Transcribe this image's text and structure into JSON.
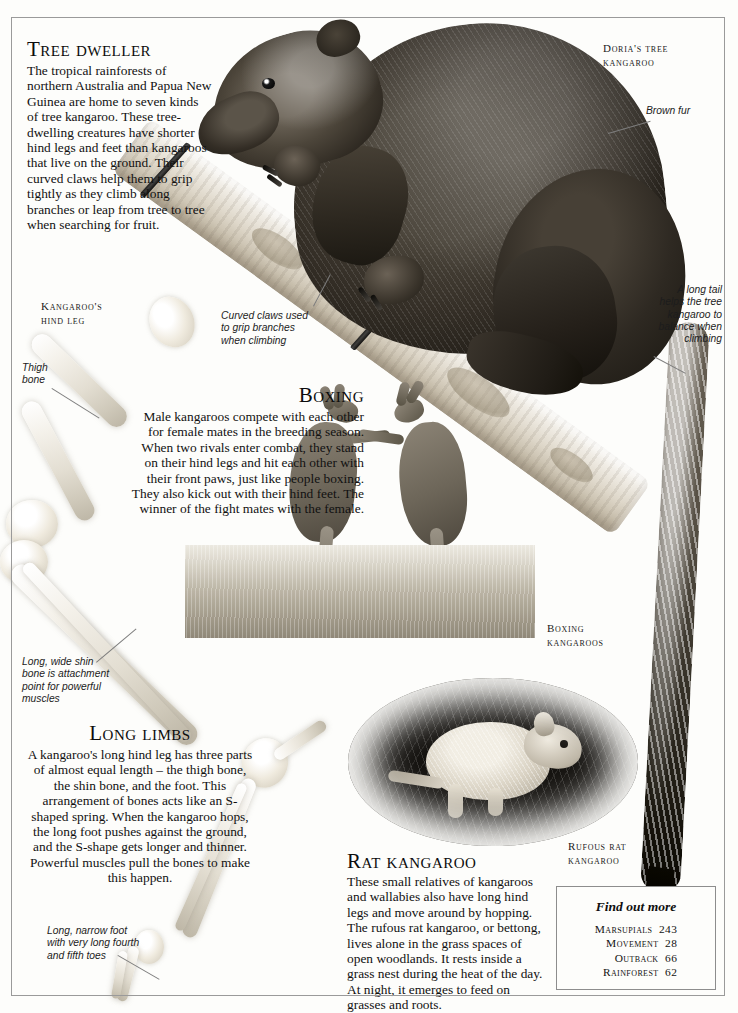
{
  "articles": {
    "tree_dweller": {
      "heading": "Tree dweller",
      "body": "The tropical rainforests of northern Australia and Papua New Guinea are home to seven kinds of tree kangaroo. These tree-dwelling creatures have shorter hind legs and feet than kangaroos that live on the ground. Their curved claws help them to grip tightly as they climb along branches or leap from tree to tree when searching for fruit."
    },
    "boxing": {
      "heading": "Boxing",
      "body": "Male kangaroos compete with each other for female mates in the breeding season. When two rivals enter combat, they stand on their hind legs and hit each other with their front paws, just like people boxing. They also kick out with their hind feet. The winner of the fight mates with the female."
    },
    "long_limbs": {
      "heading": "Long limbs",
      "body": "A kangaroo's long hind leg has three parts of almost equal length – the thigh bone, the shin bone, and the foot. This arrangement of bones acts like an S-shaped spring. When the kangaroo hops, the long foot pushes against the ground, and the S-shape gets longer and thinner. Powerful muscles pull the bones to make this happen."
    },
    "rat_kangaroo": {
      "heading": "Rat kangaroo",
      "body": "These small relatives of kangaroos and wallabies also have long hind legs and move around by hopping. The rufous rat kangaroo, or bettong, lives alone in the grass spaces of open woodlands. It rests inside a grass nest during the heat of the day. At night, it emerges to feed on grasses and roots."
    }
  },
  "labels": {
    "dorias_tree_kangaroo": "Doria's tree\nkangaroo",
    "kangaroos_hind_leg": "Kangaroo's\nhind leg",
    "boxing_kangaroos": "Boxing\nkangaroos",
    "rufous_rat_kangaroo": "Rufous rat\nkangaroo"
  },
  "annotations": {
    "brown_fur": "Brown fur",
    "long_tail": "A long tail\nhelps the tree\nkangaroo to\nbalance when\nclimbing",
    "curved_claws": "Curved claws used\nto grip branches\nwhen climbing",
    "thigh_bone": "Thigh\nbone",
    "shin_bone": "Long, wide shin\nbone is attachment\npoint for powerful\nmuscles",
    "narrow_foot": "Long, narrow foot\nwith very long fourth\nand fifth toes"
  },
  "find_out_more": {
    "title": "Find out more",
    "entries": [
      {
        "topic": "Marsupials",
        "page": "243"
      },
      {
        "topic": "Movement",
        "page": "28"
      },
      {
        "topic": "Outback",
        "page": "66"
      },
      {
        "topic": "Rainforest",
        "page": "62"
      }
    ]
  },
  "colors": {
    "paper": "#fdfdfb",
    "ink": "#111111",
    "rule": "#8d8d8d",
    "leader": "#7d7d7d"
  }
}
